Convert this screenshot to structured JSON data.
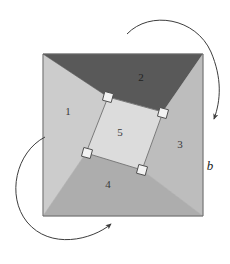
{
  "figure": {
    "background_color": "#ffffff"
  },
  "outer_square": {
    "name": "outer-square",
    "corners": {
      "top_left": [
        43,
        54
      ],
      "top_right": [
        203,
        54
      ],
      "bottom_right": [
        203,
        216
      ],
      "bottom_left": [
        43,
        216
      ]
    },
    "border_color": "#6b6b6b"
  },
  "inner_square": {
    "name": "inner-square",
    "label": "5",
    "fill": "#dcdcdc",
    "border_color": "#7a7a7a",
    "corners": {
      "top": [
        108,
        97
      ],
      "right": [
        163,
        112
      ],
      "bottom": [
        142,
        170
      ],
      "left": [
        86,
        153
      ]
    },
    "label_position": [
      120,
      136
    ]
  },
  "regions": [
    {
      "id": "region-1",
      "label": "1",
      "fill": "#cccccc",
      "label_position": [
        68,
        115
      ],
      "points": "43,54 108,97 86,153 43,216"
    },
    {
      "id": "region-2",
      "label": "2",
      "fill": "#595959",
      "label_position": [
        141,
        81
      ],
      "points": "43,54 203,54 163,112 108,97"
    },
    {
      "id": "region-3",
      "label": "3",
      "fill": "#bdbdbd",
      "label_position": [
        180,
        148
      ],
      "points": "203,54 203,216 142,170 163,112"
    },
    {
      "id": "region-4",
      "label": "4",
      "fill": "#adadad",
      "label_position": [
        108,
        188
      ],
      "points": "43,216 86,153 142,170 203,216"
    }
  ],
  "right_angle_markers": [
    {
      "id": "right-angle-top",
      "center": [
        108,
        97
      ],
      "fill": "#f2f2f2",
      "stroke": "#4d4d4d"
    },
    {
      "id": "right-angle-right",
      "center": [
        163,
        113
      ],
      "fill": "#f2f2f2",
      "stroke": "#4d4d4d"
    },
    {
      "id": "right-angle-bottom",
      "center": [
        142,
        170
      ],
      "fill": "#f2f2f2",
      "stroke": "#4d4d4d"
    },
    {
      "id": "right-angle-left",
      "center": [
        87,
        153
      ],
      "fill": "#f2f2f2",
      "stroke": "#4d4d4d"
    }
  ],
  "arrows": [
    {
      "id": "rotation-arrow-top-right",
      "direction": "clockwise",
      "path": "M 127 34 C 150 10, 196 18, 211 52 C 222 78, 221 100, 214 119",
      "arrow_tip": [
        213,
        121
      ],
      "stroke": "#3d3d3d"
    },
    {
      "id": "rotation-arrow-bottom-left",
      "direction": "counterclockwise",
      "path": "M 45 137 C 16 152, 6 196, 27 222 C 50 250, 92 240, 111 224",
      "arrow_tip": [
        113,
        222
      ],
      "stroke": "#3d3d3d"
    }
  ],
  "annotations": [
    {
      "id": "dimension-label-b",
      "text": "b",
      "position": [
        210,
        170
      ]
    }
  ]
}
